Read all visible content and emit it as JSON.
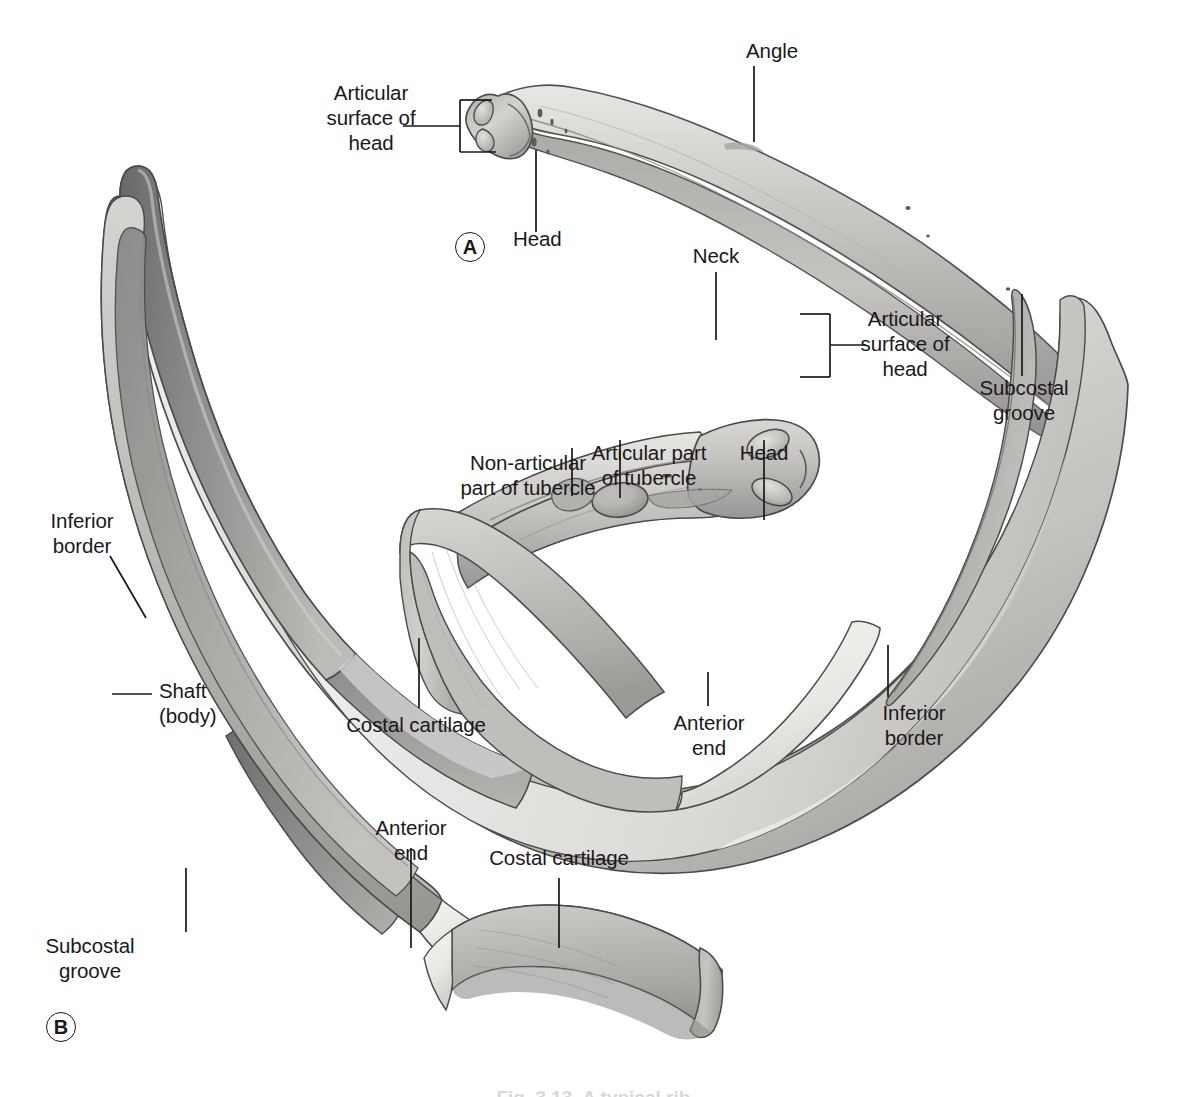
{
  "figure": {
    "panels": [
      {
        "id": "A",
        "mark": "A"
      },
      {
        "id": "B",
        "mark": "B"
      }
    ],
    "caption_partial": "Fig. 3.13  A typical rib."
  },
  "labels": {
    "a_articular_surface_of_head": "Articular\nsurface of\nhead",
    "a_head": "Head",
    "a_angle": "Angle",
    "b_neck": "Neck",
    "b_articular_surface_of_head": "Articular\nsurface of\nhead",
    "b_head": "Head",
    "b_articular_part_of_tubercle": "Articular part\nof tubercle",
    "b_non_articular_part_of_tubercle": "Non-articular\npart of tubercle",
    "b_subcostal_groove_right": "Subcostal\ngroove",
    "b_inferior_border_left": "Inferior\nborder",
    "b_shaft_body": "Shaft\n(body)",
    "b_costal_cartilage_mid": "Costal cartilage",
    "b_anterior_end_mid": "Anterior\nend",
    "b_inferior_border_right": "Inferior\nborder",
    "b_anterior_end_bottom": "Anterior\nend",
    "b_costal_cartilage_bottom": "Costal cartilage",
    "b_subcostal_groove_bottom": "Subcostal\ngroove"
  },
  "colors": {
    "ink": "#19191b",
    "outline": "#4a4a50",
    "bone_light": "#f2f1ef",
    "bone_mid": "#c9c7c4",
    "bone_dark": "#9e9c99",
    "bone_shadow": "#777573",
    "cartilage_light": "#d7d5d2",
    "cartilage_mid": "#b9b7b4",
    "cartilage_dark": "#9b9996",
    "background": "#ffffff"
  }
}
